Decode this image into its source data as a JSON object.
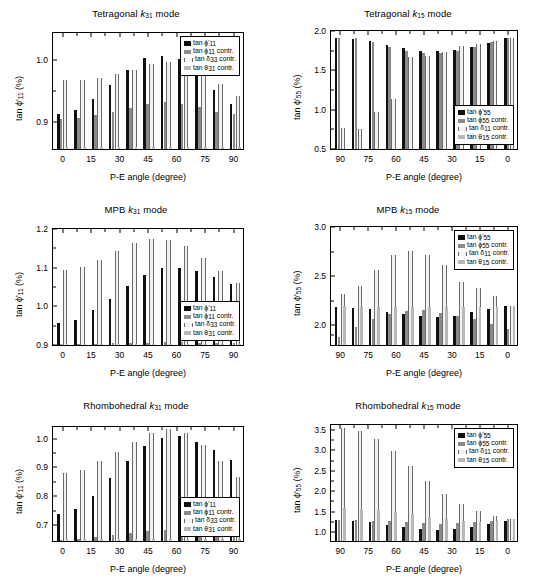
{
  "figure": {
    "width": 545,
    "height": 588,
    "background": "#ffffff",
    "layout": "2 columns x 3 rows of bar charts"
  },
  "common": {
    "xlabel": "P-E angle (degree)",
    "colors": {
      "series0": "#101010",
      "series1": "#8a8a8a",
      "series2": "#f2f2f2",
      "series3": "#b8b8b8",
      "axis": "#000000",
      "background": "#ffffff"
    }
  },
  "panels": [
    {
      "id": "tetragonal-k31",
      "title_prefix": "Tetragonal ",
      "title_ital": "k",
      "title_sub": "31",
      "title_suffix": " mode",
      "title_full": "Tetragonal k31 mode",
      "legend_position": "top-right",
      "chart_data": {
        "type": "bar",
        "title": "Tetragonal k31 mode",
        "xlabel": "P-E angle (degree)",
        "ylabel": "tan ϕ'11 (%)",
        "ylim": [
          0.855,
          1.045
        ],
        "yticks": [
          0.9,
          1.0
        ],
        "ytick_labels": [
          "0.9",
          "1.0"
        ],
        "yminor": [
          0.95
        ],
        "xlim": [
          -5,
          95
        ],
        "x": [
          0,
          9,
          18,
          27,
          36,
          45,
          54,
          63,
          72,
          81,
          90
        ],
        "xticks": [
          0,
          15,
          30,
          45,
          60,
          75,
          90
        ],
        "xtick_labels": [
          "0",
          "15",
          "30",
          "45",
          "60",
          "75",
          "90"
        ],
        "xminor": [
          7.5,
          22.5,
          37.5,
          52.5,
          67.5,
          82.5
        ],
        "grid": false,
        "legend": [
          "tan ϕ'11",
          "tan ϕ 11 contr.",
          "tan δ 33 contr.",
          "tan θ 31 contr."
        ],
        "series": [
          {
            "name": "tan ϕ'11",
            "values": [
              0.912,
              0.918,
              0.936,
              0.958,
              0.983,
              1.002,
              1.004,
              1.0,
              0.977,
              0.95,
              0.928
            ]
          },
          {
            "name": "tan ϕ 11 contr.",
            "values": [
              0.903,
              0.905,
              0.909,
              0.915,
              0.921,
              0.927,
              0.93,
              0.928,
              0.923,
              0.915,
              0.911
            ]
          },
          {
            "name": "tan δ 33 contr.",
            "values": [
              0.966,
              0.966,
              0.969,
              0.975,
              0.983,
              0.992,
              0.995,
              0.99,
              0.978,
              0.96,
              0.94
            ]
          },
          {
            "name": "tan θ 31 contr.",
            "values": [
              0.858,
              0.858,
              0.858,
              0.858,
              0.858,
              0.858,
              0.858,
              0.858,
              0.858,
              0.858,
              0.858
            ]
          }
        ]
      }
    },
    {
      "id": "tetragonal-k15",
      "title_prefix": "Tetragonal ",
      "title_ital": "k",
      "title_sub": "15",
      "title_suffix": " mode",
      "title_full": "Tetragonal k15 mode",
      "legend_position": "bottom-right",
      "chart_data": {
        "type": "bar",
        "title": "Tetragonal k15 mode",
        "xlabel": "P-E angle (degree)",
        "ylabel": "tan ϕ'55 (%)",
        "ylim": [
          0.5,
          2.0
        ],
        "yticks": [
          0.5,
          1.0,
          1.5,
          2.0
        ],
        "ytick_labels": [
          "0.5",
          "1.0",
          "1.5",
          "2.0"
        ],
        "yminor": [
          0.75,
          1.25,
          1.75
        ],
        "xlim": [
          95,
          -5
        ],
        "x_reversed": true,
        "x": [
          90,
          81,
          72,
          63,
          54,
          45,
          36,
          27,
          18,
          9,
          0
        ],
        "xticks": [
          90,
          75,
          60,
          45,
          30,
          15,
          0
        ],
        "xtick_labels": [
          "90",
          "75",
          "60",
          "45",
          "30",
          "15",
          "0"
        ],
        "xminor": [
          82.5,
          67.5,
          52.5,
          37.5,
          22.5,
          7.5
        ],
        "grid": false,
        "legend": [
          "tan ϕ'55",
          "tan ϕ 55 contr.",
          "tan δ 11 contr.",
          "tan θ 15 contr."
        ],
        "series": [
          {
            "name": "tan ϕ'55",
            "values": [
              1.888,
              1.878,
              1.848,
              1.8,
              1.768,
              1.73,
              1.722,
              1.735,
              1.772,
              1.828,
              1.888
            ]
          },
          {
            "name": "tan ϕ 55 contr.",
            "values": [
              1.888,
              1.888,
              1.838,
              1.77,
              1.722,
              1.7,
              1.7,
              1.722,
              1.77,
              1.838,
              1.888
            ]
          },
          {
            "name": "tan δ 11 contr.",
            "values": [
              0.76,
              0.745,
              0.965,
              1.12,
              1.65,
              1.66,
              1.71,
              1.79,
              1.81,
              1.855,
              1.888
            ]
          },
          {
            "name": "tan θ 15 contr.",
            "values": [
              0.505,
              0.505,
              0.505,
              0.505,
              0.505,
              0.505,
              0.505,
              0.505,
              0.505,
              0.505,
              0.505
            ]
          }
        ]
      }
    },
    {
      "id": "mpb-k31",
      "title_prefix": "MPB ",
      "title_ital": "k",
      "title_sub": "31",
      "title_suffix": " mode",
      "title_full": "MPB k31 mode",
      "legend_position": "bottom-right",
      "chart_data": {
        "type": "bar",
        "title": "MPB k31 mode",
        "xlabel": "P-E angle (degree)",
        "ylabel": "tan ϕ'11 (%)",
        "ylim": [
          0.9,
          1.2
        ],
        "yticks": [
          0.9,
          1.0,
          1.1,
          1.2
        ],
        "ytick_labels": [
          "0.9",
          "1.0",
          "1.1",
          "1.2"
        ],
        "yminor": [
          0.95,
          1.05,
          1.15
        ],
        "xlim": [
          -5,
          95
        ],
        "x": [
          0,
          9,
          18,
          27,
          36,
          45,
          54,
          63,
          72,
          81,
          90
        ],
        "xticks": [
          0,
          15,
          30,
          45,
          60,
          75,
          90
        ],
        "xtick_labels": [
          "0",
          "15",
          "30",
          "45",
          "60",
          "75",
          "90"
        ],
        "xminor": [
          7.5,
          22.5,
          37.5,
          52.5,
          67.5,
          82.5
        ],
        "grid": false,
        "legend": [
          "tan ϕ'11",
          "tan ϕ 11 contr.",
          "tan δ 33 contr.",
          "tan θ 31 contr."
        ],
        "series": [
          {
            "name": "tan ϕ'11",
            "values": [
              0.955,
              0.963,
              0.988,
              1.017,
              1.05,
              1.078,
              1.095,
              1.097,
              1.087,
              1.072,
              1.055
            ]
          },
          {
            "name": "tan ϕ 11 contr.",
            "values": [
              0.902,
              0.902,
              0.903,
              0.904,
              0.905,
              0.906,
              0.907,
              0.907,
              0.906,
              0.905,
              0.904
            ]
          },
          {
            "name": "tan δ 33 contr.",
            "values": [
              1.09,
              1.098,
              1.117,
              1.14,
              1.16,
              1.17,
              1.168,
              1.152,
              1.122,
              1.088,
              1.057
            ]
          },
          {
            "name": "tan θ 31 contr.",
            "values": [
              0.903,
              0.903,
              0.903,
              0.903,
              0.903,
              0.903,
              0.903,
              0.903,
              0.903,
              0.903,
              0.903
            ]
          }
        ],
        "extra_bars_right": [
          1.042,
          1.038
        ]
      }
    },
    {
      "id": "mpb-k15",
      "title_prefix": "MPB ",
      "title_ital": "k",
      "title_sub": "15",
      "title_suffix": " mode",
      "title_full": "MPB k15 mode",
      "legend_position": "top-right",
      "chart_data": {
        "type": "bar",
        "title": "MPB k15 mode",
        "xlabel": "P-E angle (degree)",
        "ylabel": "tan ϕ'55 (%)",
        "ylim": [
          1.8,
          3.0
        ],
        "yticks": [
          2.0,
          2.5,
          3.0
        ],
        "ytick_labels": [
          "2.0",
          "2.5",
          "3.0"
        ],
        "yminor": [
          1.9,
          2.25,
          2.75
        ],
        "xlim": [
          95,
          -5
        ],
        "x_reversed": true,
        "x": [
          90,
          81,
          72,
          63,
          54,
          45,
          36,
          27,
          18,
          9,
          0
        ],
        "xticks": [
          90,
          75,
          60,
          45,
          30,
          15,
          0
        ],
        "xtick_labels": [
          "90",
          "75",
          "60",
          "45",
          "30",
          "15",
          "0"
        ],
        "xminor": [
          82.5,
          67.5,
          52.5,
          37.5,
          22.5,
          7.5
        ],
        "grid": false,
        "legend": [
          "tan ϕ'55",
          "tan ϕ 55 contr.",
          "tan δ 11 contr.",
          "tan θ 15 contr."
        ],
        "series": [
          {
            "name": "tan ϕ'55",
            "values": [
              2.178,
              2.175,
              2.16,
              2.13,
              2.108,
              2.088,
              2.082,
              2.095,
              2.132,
              2.163,
              2.188
            ]
          },
          {
            "name": "tan ϕ 55 contr.",
            "values": [
              1.88,
              1.978,
              2.06,
              2.108,
              2.14,
              2.148,
              2.122,
              2.09,
              2.063,
              2.01,
              1.96
            ]
          },
          {
            "name": "tan δ 11 contr.",
            "values": [
              2.312,
              2.392,
              2.548,
              2.7,
              2.742,
              2.705,
              2.598,
              2.432,
              2.368,
              2.288,
              2.19
            ]
          },
          {
            "name": "tan θ 15 contr.",
            "values": [
              2.19,
              2.185,
              2.185,
              2.185,
              2.185,
              2.185,
              2.185,
              2.185,
              2.185,
              2.185,
              2.188
            ]
          }
        ]
      }
    },
    {
      "id": "rhombohedral-k31",
      "title_prefix": "Rhombohedral ",
      "title_ital": "k",
      "title_sub": "31",
      "title_suffix": " mode",
      "title_full": "Rhombohedral k31 mode",
      "legend_position": "bottom-right",
      "chart_data": {
        "type": "bar",
        "title": "Rhombohedral k31 mode",
        "xlabel": "P-E angle (degree)",
        "ylabel": "tan ϕ'11 (%)",
        "ylim": [
          0.645,
          1.04
        ],
        "yticks": [
          0.7,
          0.8,
          0.9,
          1.0
        ],
        "ytick_labels": [
          "0.7",
          "0.8",
          "0.9",
          "1.0"
        ],
        "yminor": [
          0.75,
          0.85,
          0.95
        ],
        "xlim": [
          -5,
          95
        ],
        "x": [
          0,
          9,
          18,
          27,
          36,
          45,
          54,
          63,
          72,
          81,
          90
        ],
        "xticks": [
          0,
          15,
          30,
          45,
          60,
          75,
          90
        ],
        "xtick_labels": [
          "0",
          "15",
          "30",
          "45",
          "60",
          "75",
          "90"
        ],
        "xminor": [
          7.5,
          22.5,
          37.5,
          52.5,
          67.5,
          82.5
        ],
        "grid": false,
        "legend": [
          "tan ϕ'11",
          "tan ϕ 11 contr.",
          "tan δ 33 contr.",
          "tan θ 31 contr."
        ],
        "series": [
          {
            "name": "tan ϕ'11",
            "values": [
              0.738,
              0.755,
              0.798,
              0.858,
              0.918,
              0.968,
              0.997,
              1.002,
              0.982,
              0.955,
              0.922
            ]
          },
          {
            "name": "tan ϕ 11 contr.",
            "values": [
              0.65,
              0.652,
              0.658,
              0.665,
              0.672,
              0.678,
              0.682,
              0.682,
              0.678,
              0.67,
              0.662
            ]
          },
          {
            "name": "tan δ 33 contr.",
            "values": [
              0.875,
              0.888,
              0.918,
              0.948,
              0.982,
              1.012,
              1.025,
              1.012,
              0.972,
              0.918,
              0.862
            ]
          },
          {
            "name": "tan θ 31 contr.",
            "values": [
              0.652,
              0.652,
              0.652,
              0.652,
              0.652,
              0.652,
              0.652,
              0.652,
              0.652,
              0.652,
              0.652
            ]
          }
        ],
        "extra_bars_right": [
          0.903,
          0.892
        ]
      }
    },
    {
      "id": "rhombohedral-k15",
      "title_prefix": "Rhombohedral ",
      "title_ital": "k",
      "title_sub": "15",
      "title_suffix": " mode",
      "title_full": "Rhombohedral k15 mode",
      "legend_position": "top-right",
      "chart_data": {
        "type": "bar",
        "title": "Rhombohedral k15 mode",
        "xlabel": "P-E angle (degree)",
        "ylabel": "tan ϕ'55 (%)",
        "ylim": [
          0.78,
          3.62
        ],
        "yticks": [
          1.0,
          1.5,
          2.0,
          2.5,
          3.0,
          3.5
        ],
        "ytick_labels": [
          "1.0",
          "1.5",
          "2.0",
          "2.5",
          "3.0",
          "3.5"
        ],
        "yminor": [
          1.25,
          1.75,
          2.25,
          2.75,
          3.25
        ],
        "xlim": [
          95,
          -5
        ],
        "x_reversed": true,
        "x": [
          90,
          81,
          72,
          63,
          54,
          45,
          36,
          27,
          18,
          9,
          0
        ],
        "xticks": [
          90,
          75,
          60,
          45,
          30,
          15,
          0
        ],
        "xtick_labels": [
          "90",
          "75",
          "60",
          "45",
          "30",
          "15",
          "0"
        ],
        "xminor": [
          82.5,
          67.5,
          52.5,
          37.5,
          22.5,
          7.5
        ],
        "grid": false,
        "legend": [
          "tan ϕ'55",
          "tan ϕ 55 contr.",
          "tan δ 11 contr.",
          "tan θ 15 contr."
        ],
        "series": [
          {
            "name": "tan ϕ'55",
            "values": [
              1.282,
              1.27,
              1.238,
              1.172,
              1.112,
              1.068,
              1.05,
              1.072,
              1.128,
              1.198,
              1.258
            ]
          },
          {
            "name": "tan ϕ 55 contr.",
            "values": [
              1.29,
              1.288,
              1.272,
              1.25,
              1.228,
              1.208,
              1.198,
              1.21,
              1.238,
              1.272,
              1.3
            ]
          },
          {
            "name": "tan δ 11 contr.",
            "values": [
              3.49,
              3.43,
              3.245,
              2.955,
              2.59,
              2.222,
              1.918,
              1.672,
              1.498,
              1.375,
              1.302
            ]
          },
          {
            "name": "tan θ 15 contr.",
            "values": [
              1.568,
              1.555,
              1.525,
              1.478,
              1.42,
              1.358,
              1.3,
              1.26,
              1.23,
              1.272,
              1.302
            ]
          }
        ]
      }
    }
  ]
}
